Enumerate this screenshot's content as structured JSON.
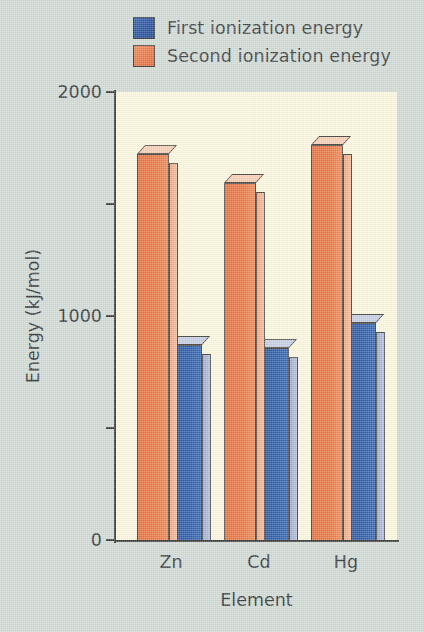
{
  "legend": {
    "items": [
      {
        "label": "First ionization energy",
        "color": "#2c5cab",
        "key": "first"
      },
      {
        "label": "Second ionization energy",
        "color": "#eb763f",
        "key": "second"
      }
    ]
  },
  "axes": {
    "y_title": "Energy (kJ/mol)",
    "x_title": "Element",
    "y_ticks_labeled": [
      "2000",
      "1000",
      "0"
    ],
    "y_ticks_minor": [
      "1500",
      "500"
    ]
  },
  "chart_data": {
    "type": "bar",
    "title": "",
    "xlabel": "Element",
    "ylabel": "Energy (kJ/mol)",
    "categories": [
      "Zn",
      "Cd",
      "Hg"
    ],
    "series": [
      {
        "name": "First ionization energy",
        "color": "#2c5cab",
        "values": [
          875,
          860,
          970
        ]
      },
      {
        "name": "Second ionization energy",
        "color": "#eb763f",
        "values": [
          1725,
          1595,
          1765
        ]
      }
    ],
    "ylim": [
      0,
      2000
    ],
    "yticks": [
      0,
      500,
      1000,
      1500,
      2000
    ],
    "ytick_labels": [
      "0",
      "",
      "1000",
      "",
      "2000"
    ],
    "grid": false,
    "legend_position": "top",
    "plot_background": "#fbf6dd",
    "figure_background": "#cfd9d3",
    "style": "3d-bars"
  }
}
